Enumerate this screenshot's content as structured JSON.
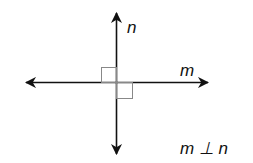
{
  "diagram": {
    "lines": [
      {
        "name": "n",
        "orientation": "vertical",
        "label": "n"
      },
      {
        "name": "m",
        "orientation": "horizontal",
        "label": "m"
      }
    ],
    "statement": "m ⊥ n",
    "right_angle_marks": 2,
    "colors": {
      "line": "#111111",
      "mark": "#888888"
    }
  }
}
